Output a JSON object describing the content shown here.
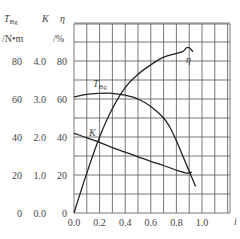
{
  "chart_data": {
    "type": "line",
    "title": "",
    "xlabel": "i",
    "y_axes": [
      {
        "label": "T_Bg",
        "unit": "/N·m",
        "ticks": [
          "0",
          "20",
          "40",
          "60",
          "80"
        ]
      },
      {
        "label": "K",
        "unit": "",
        "ticks": [
          "0.0",
          "1.0",
          "2.0",
          "3.0",
          "4.0"
        ]
      },
      {
        "label": "η",
        "unit": "/%",
        "ticks": [
          "0",
          "20",
          "40",
          "60",
          "80"
        ]
      }
    ],
    "x_ticks": [
      "0.0",
      "0.2",
      "0.4",
      "0.6",
      "0.8",
      "1.0"
    ],
    "xlim": [
      0,
      1.1
    ],
    "ylim": [
      0,
      95
    ],
    "grid": true,
    "series": [
      {
        "name": "η",
        "axis": "η (%)",
        "x": [
          0.0,
          0.1,
          0.2,
          0.3,
          0.4,
          0.5,
          0.6,
          0.7,
          0.8,
          0.85,
          0.88,
          0.9,
          0.93
        ],
        "values": [
          0,
          21,
          40,
          55,
          66,
          73,
          78,
          82,
          84,
          85,
          87,
          87,
          85
        ]
      },
      {
        "name": "T_Bg",
        "axis": "T_Bg (N·m)",
        "x": [
          0.0,
          0.1,
          0.2,
          0.3,
          0.4,
          0.5,
          0.6,
          0.7,
          0.75,
          0.8,
          0.85,
          0.9,
          0.95
        ],
        "values": [
          61,
          62.5,
          63,
          63,
          62,
          60,
          56,
          50,
          45,
          38,
          30,
          22,
          14
        ]
      },
      {
        "name": "K",
        "axis": "K",
        "x": [
          0.0,
          0.1,
          0.2,
          0.3,
          0.4,
          0.5,
          0.6,
          0.7,
          0.8,
          0.88,
          0.92
        ],
        "values": [
          2.1,
          1.98,
          1.86,
          1.72,
          1.6,
          1.48,
          1.36,
          1.25,
          1.13,
          1.05,
          1.08
        ]
      }
    ],
    "annotations": [
      "T_Bg",
      "K",
      "η"
    ]
  },
  "labels": {
    "axis_t": "T",
    "axis_t_sub": "Bg",
    "axis_k": "K",
    "axis_eta": "η",
    "unit_t": "/N•m",
    "unit_eta": "/%",
    "xlabel": "i",
    "curve_eta": "η",
    "curve_t": "T",
    "curve_t_sub": "Bg",
    "curve_k": "K"
  }
}
